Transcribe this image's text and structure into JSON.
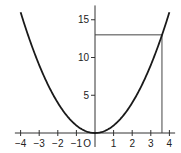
{
  "chart_data": {
    "type": "line",
    "title": "",
    "function": "y = x^2",
    "xlabel": "",
    "ylabel": "",
    "origin_label": "O",
    "xlim": [
      -4.2,
      4.2
    ],
    "ylim": [
      0,
      16.5
    ],
    "x_ticks": [
      -4,
      -3,
      -2,
      -1,
      1,
      2,
      3,
      4
    ],
    "x_tick_labels": [
      "−4",
      "−3",
      "−2",
      "−1",
      "1",
      "2",
      "3",
      "4"
    ],
    "y_ticks": [
      5,
      10,
      15
    ],
    "y_tick_labels": [
      "5",
      "10",
      "15"
    ],
    "series": [
      {
        "name": "y = x^2",
        "x": [
          -4,
          -3.5,
          -3,
          -2.5,
          -2,
          -1.5,
          -1,
          -0.5,
          0,
          0.5,
          1,
          1.5,
          2,
          2.5,
          3,
          3.5,
          4
        ],
        "values": [
          16,
          12.25,
          9,
          6.25,
          4,
          2.25,
          1,
          0.25,
          0,
          0.25,
          1,
          2.25,
          4,
          6.25,
          9,
          12.25,
          16
        ]
      }
    ],
    "annotations": [
      {
        "type": "hline",
        "y": 13,
        "x_from": 0,
        "x_to": 3.6
      },
      {
        "type": "vline",
        "x": 3.6,
        "y_from": 0,
        "y_to": 13
      }
    ],
    "grid": false,
    "legend": "none"
  },
  "colors": {
    "curve": "#1a1a1a",
    "axes": "#333333",
    "guide_lines": "#444444",
    "background": "#ffffff"
  }
}
